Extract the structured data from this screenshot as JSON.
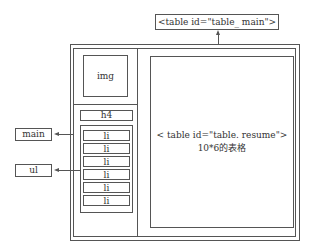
{
  "title_label": "<table id=\"table_ main\">",
  "left_column": {
    "img_label": "img",
    "h4_label": "h4",
    "list_items": [
      "li",
      "li",
      "li",
      "li",
      "li",
      "li"
    ]
  },
  "right_content": {
    "line1": "< table id=\"table. resume\">",
    "line2": "10*6的表格"
  },
  "callouts": {
    "main_label": "main",
    "ul_label": "ul"
  }
}
